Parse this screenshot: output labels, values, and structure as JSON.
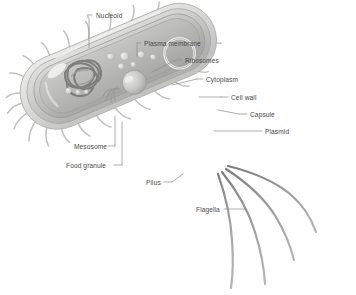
{
  "diagram": {
    "background_color": "#ffffff",
    "label_color": "#4a4a4a",
    "palette": {
      "capsule": "#d8d8d6",
      "cell_wall": "#c2c2c0",
      "plasma_membrane": "#b4b4b2",
      "cytoplasm": "#b9b9b6",
      "nucleoid": "#8e8e8c",
      "ribosome": "#dcdcda",
      "flagella": "#8a8a88",
      "pili": "#c9c9c7",
      "leader_line": "#8c8c8c"
    },
    "labels": [
      {
        "id": "nucleoid",
        "text": "Nucleoid",
        "x": 96,
        "y": 12
      },
      {
        "id": "plasma-membrane",
        "text": "Plasma membrane",
        "x": 144,
        "y": 40
      },
      {
        "id": "ribosomes",
        "text": "Ribosomes",
        "x": 185,
        "y": 57
      },
      {
        "id": "cytoplasm",
        "text": "Cytoplasm",
        "x": 206,
        "y": 76
      },
      {
        "id": "cell-wall",
        "text": "Cell wall",
        "x": 231,
        "y": 94
      },
      {
        "id": "capsule",
        "text": "Capsule",
        "x": 250,
        "y": 111
      },
      {
        "id": "plasmid",
        "text": "Plasmid",
        "x": 265,
        "y": 128
      },
      {
        "id": "mesosome",
        "text": "Mesosome",
        "x": 74,
        "y": 143
      },
      {
        "id": "food-granule",
        "text": "Food granule",
        "x": 66,
        "y": 162
      },
      {
        "id": "pilus",
        "text": "Pilus",
        "x": 146,
        "y": 179
      },
      {
        "id": "flagella",
        "text": "Flagella",
        "x": 196,
        "y": 206
      }
    ],
    "parts": [
      {
        "name": "capsule",
        "description": "outermost gelatinous layer enclosing the cell"
      },
      {
        "name": "cell wall",
        "description": "rigid layer beneath the capsule"
      },
      {
        "name": "plasma membrane",
        "description": "inner membrane enclosing the cytoplasm"
      },
      {
        "name": "cytoplasm",
        "description": "interior matrix of the cell"
      },
      {
        "name": "nucleoid",
        "description": "coiled circular DNA region"
      },
      {
        "name": "plasmid",
        "description": "small circular DNA ring near right pole"
      },
      {
        "name": "ribosomes",
        "description": "small spherical granules in cytoplasm"
      },
      {
        "name": "food granule",
        "description": "large storage sphere"
      },
      {
        "name": "mesosome",
        "description": "infolding of the plasma membrane"
      },
      {
        "name": "pili",
        "description": "short hair-like appendages around the cell"
      },
      {
        "name": "flagella",
        "description": "four long whip-like tails at the right pole"
      }
    ],
    "counts": {
      "flagella": 4,
      "ribosomes": 9,
      "plasmids": 1,
      "food_granules": 1
    }
  }
}
